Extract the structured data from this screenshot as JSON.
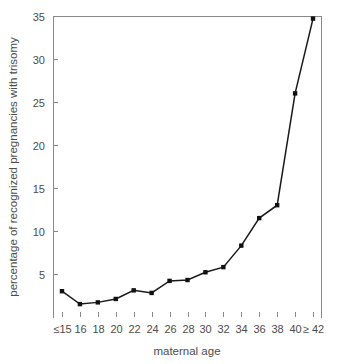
{
  "chart_data": {
    "type": "line",
    "title": "",
    "xlabel": "maternal age",
    "ylabel": "percentage of recognized pregnancies with trisomy",
    "categories": [
      "≤15",
      "16",
      "18",
      "20",
      "22",
      "24",
      "26",
      "28",
      "30",
      "32",
      "34",
      "36",
      "38",
      "40",
      "≥ 42"
    ],
    "values": [
      3.0,
      1.5,
      1.7,
      2.1,
      3.1,
      2.8,
      4.2,
      4.3,
      5.2,
      5.8,
      8.3,
      11.5,
      13.0,
      26.0,
      34.7
    ],
    "ylim": [
      0,
      35
    ],
    "yticks": [
      5,
      10,
      15,
      20,
      25,
      30,
      35
    ],
    "ytick_labels": [
      "5",
      "10",
      "15",
      "20",
      "25",
      "30",
      "35"
    ],
    "grid": false,
    "legend": false,
    "legend_position": "none",
    "series": [
      {
        "name": "percentage of recognized pregnancies with trisomy",
        "values": [
          3.0,
          1.5,
          1.7,
          2.1,
          3.1,
          2.8,
          4.2,
          4.3,
          5.2,
          5.8,
          8.3,
          11.5,
          13.0,
          26.0,
          34.7
        ],
        "marker": "square",
        "color": "#111111"
      }
    ],
    "colors": {
      "line": "#111111",
      "marker": "#111111",
      "axis": "#8a8a8a",
      "text": "#4d4d4d",
      "background": "#ffffff"
    },
    "axis_box": {
      "left": 53,
      "right": 322,
      "top": 16,
      "bottom": 317
    }
  }
}
